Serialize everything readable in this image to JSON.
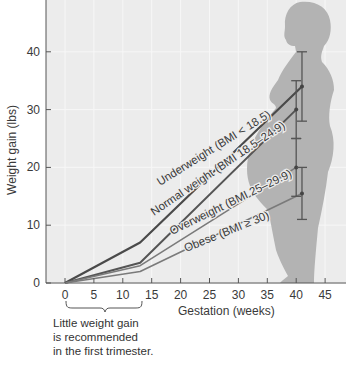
{
  "chart_data": {
    "type": "line",
    "title": "",
    "xlabel": "Gestation (weeks)",
    "ylabel": "Weight gain (lbs)",
    "xlim": [
      -3,
      48
    ],
    "ylim": [
      0,
      48
    ],
    "x_ticks": [
      0,
      5,
      10,
      15,
      20,
      25,
      30,
      35,
      40,
      45
    ],
    "y_ticks": [
      0,
      10,
      20,
      30,
      40
    ],
    "grid": true,
    "series": [
      {
        "name": "Underweight (BMI < 18.5)",
        "color": "#4a4a4a",
        "x": [
          0,
          13,
          41
        ],
        "values": [
          0,
          7,
          34
        ],
        "error_bar": {
          "x": 41,
          "low": 28,
          "high": 40
        }
      },
      {
        "name": "Normal weight (BMI 18.5–24.9)",
        "color": "#555555",
        "x": [
          0,
          13,
          40
        ],
        "values": [
          0,
          3.5,
          30
        ],
        "error_bar": {
          "x": 40,
          "low": 25,
          "high": 35
        }
      },
      {
        "name": "Overweight (BMI 25–29.9)",
        "color": "#7a7a7a",
        "x": [
          0,
          13,
          40
        ],
        "values": [
          0,
          3,
          20
        ],
        "error_bar": {
          "x": 40,
          "low": 15,
          "high": 25
        }
      },
      {
        "name": "Obese (BMI ≥ 30)",
        "color": "#7a7a7a",
        "x": [
          0,
          13,
          41
        ],
        "values": [
          0,
          2,
          15.5
        ],
        "error_bar": {
          "x": 41,
          "low": 11,
          "high": 20
        }
      }
    ],
    "annotations": [
      {
        "text": "Little weight gain is recommended in the first trimester.",
        "x_range": [
          0,
          13
        ]
      }
    ],
    "legend_position": "inline labels along lines",
    "background_figure": "pregnant woman silhouette"
  },
  "labels": {
    "ylabel": "Weight gain (lbs)",
    "xlabel": "Gestation (weeks)",
    "note_lines": [
      "Little weight gain",
      "is recommended",
      "in the first trimester."
    ],
    "series_labels": [
      "Underweight (BMI < 18.5)",
      "Normal weight (BMI 18.5–24.9)",
      "Overweight (BMI 25–29.9)",
      "Obese (BMI ≥ 30)"
    ]
  },
  "colors": {
    "plot_bg": "#ececec",
    "grid": "#f7f7f7",
    "silhouette": "#b3b3b3",
    "axis": "#555555"
  }
}
